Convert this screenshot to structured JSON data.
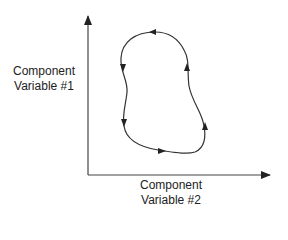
{
  "diagram": {
    "type": "phase-space limit cycle",
    "y_axis": {
      "label_line1": "Component",
      "label_line2": "Variable #1"
    },
    "x_axis": {
      "label_line1": "Component",
      "label_line2": "Variable #2"
    },
    "trajectory": {
      "shape": "closed loop",
      "direction": "counterclockwise",
      "arrow_count": 6
    },
    "colors": {
      "line": "#333333",
      "text": "#222222",
      "background": "#ffffff"
    }
  }
}
